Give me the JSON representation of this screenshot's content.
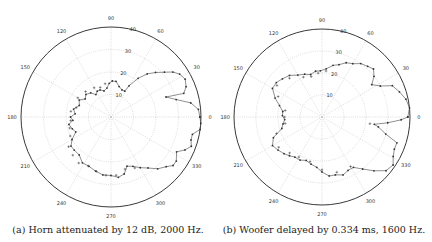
{
  "chart_data": [
    {
      "type": "polar-line",
      "title": "",
      "caption": "(a) Horn attenuated by 12 dB, 2000 Hz.",
      "angle_ticks": [
        0,
        30,
        60,
        90,
        120,
        150,
        180,
        210,
        240,
        270,
        300,
        330
      ],
      "radial_ticks": [
        10,
        20,
        30,
        40
      ],
      "radial_labels": [
        "10",
        "20",
        "30",
        "40"
      ],
      "rlim": [
        0,
        40
      ],
      "grid": true,
      "center_px": [
        111,
        117
      ],
      "outer_radius_px": 90,
      "series": [
        {
          "name": "measured",
          "marker": "dot",
          "points": [
            [
              0,
              39.5
            ],
            [
              5,
              39
            ],
            [
              10,
              36
            ],
            [
              15,
              30
            ],
            [
              20,
              26
            ],
            [
              18,
              34
            ],
            [
              22,
              36
            ],
            [
              27,
              37
            ],
            [
              32,
              36
            ],
            [
              36,
              34
            ],
            [
              40,
              31
            ],
            [
              45,
              28
            ],
            [
              50,
              25
            ],
            [
              55,
              21
            ],
            [
              60,
              16
            ],
            [
              62,
              13
            ],
            [
              68,
              13
            ],
            [
              75,
              14
            ],
            [
              82,
              16
            ],
            [
              88,
              16
            ],
            [
              93,
              15
            ],
            [
              98,
              13
            ],
            [
              105,
              12
            ],
            [
              112,
              13
            ],
            [
              118,
              13
            ],
            [
              124,
              12
            ],
            [
              130,
              14
            ],
            [
              138,
              15
            ],
            [
              145,
              14
            ],
            [
              152,
              16
            ],
            [
              160,
              15
            ],
            [
              168,
              17
            ],
            [
              175,
              16
            ],
            [
              180,
              18
            ],
            [
              185,
              17
            ],
            [
              190,
              19
            ],
            [
              197,
              18
            ],
            [
              203,
              17
            ],
            [
              210,
              20
            ],
            [
              216,
              22
            ],
            [
              222,
              22
            ],
            [
              230,
              22
            ],
            [
              238,
              24
            ],
            [
              246,
              24
            ],
            [
              254,
              25
            ],
            [
              262,
              26
            ],
            [
              270,
              26
            ],
            [
              277,
              27
            ],
            [
              283,
              26
            ],
            [
              288,
              23
            ],
            [
              294,
              24
            ],
            [
              300,
              26
            ],
            [
              306,
              28
            ],
            [
              312,
              31
            ],
            [
              318,
              33
            ],
            [
              322,
              35
            ],
            [
              326,
              35
            ],
            [
              332,
              33
            ],
            [
              336,
              36
            ],
            [
              340,
              38
            ],
            [
              344,
              37
            ],
            [
              348,
              37
            ],
            [
              352,
              40
            ],
            [
              356,
              40
            ],
            [
              360,
              39.5
            ]
          ]
        },
        {
          "name": "predicted",
          "marker": "plus",
          "points": [
            [
              100,
              15
            ],
            [
              110,
              14
            ],
            [
              120,
              15
            ],
            [
              135,
              16
            ],
            [
              150,
              17
            ],
            [
              165,
              16
            ],
            [
              172,
              18
            ],
            [
              185,
              18
            ],
            [
              195,
              19
            ],
            [
              205,
              20
            ],
            [
              215,
              23
            ],
            [
              225,
              24
            ],
            [
              235,
              25
            ],
            [
              245,
              24
            ],
            [
              255,
              25
            ],
            [
              265,
              26
            ],
            [
              275,
              26
            ],
            [
              285,
              24
            ],
            [
              295,
              25
            ]
          ]
        }
      ],
      "xlabel": "",
      "ylabel": ""
    },
    {
      "type": "polar-line",
      "title": "",
      "caption": "(b) Woofer delayed by 0.334 ms, 1600 Hz.",
      "angle_ticks": [
        0,
        30,
        60,
        90,
        120,
        150,
        180,
        210,
        240,
        270,
        300,
        330
      ],
      "radial_ticks": [
        10,
        20,
        30,
        40
      ],
      "radial_labels": [
        "10",
        "20",
        "30",
        "40"
      ],
      "rlim": [
        0,
        40
      ],
      "grid": true,
      "center_px": [
        322,
        117
      ],
      "outer_radius_px": 88,
      "series": [
        {
          "name": "measured",
          "marker": "dot",
          "points": [
            [
              0,
              39
            ],
            [
              6,
              40
            ],
            [
              12,
              39
            ],
            [
              18,
              37
            ],
            [
              24,
              35
            ],
            [
              28,
              30
            ],
            [
              33,
              27
            ],
            [
              38,
              30
            ],
            [
              43,
              32
            ],
            [
              48,
              31
            ],
            [
              54,
              30
            ],
            [
              60,
              28
            ],
            [
              66,
              27
            ],
            [
              72,
              25
            ],
            [
              78,
              24
            ],
            [
              85,
              22
            ],
            [
              92,
              21
            ],
            [
              98,
              21
            ],
            [
              105,
              20
            ],
            [
              112,
              21
            ],
            [
              120,
              22
            ],
            [
              128,
              24
            ],
            [
              136,
              25
            ],
            [
              143,
              26
            ],
            [
              150,
              26
            ],
            [
              158,
              23
            ],
            [
              165,
              20
            ],
            [
              172,
              18
            ],
            [
              178,
              18
            ],
            [
              184,
              17
            ],
            [
              190,
              18
            ],
            [
              196,
              19
            ],
            [
              203,
              24
            ],
            [
              210,
              26
            ],
            [
              217,
              25
            ],
            [
              224,
              24
            ],
            [
              230,
              23
            ],
            [
              236,
              22
            ],
            [
              243,
              22
            ],
            [
              250,
              21
            ],
            [
              257,
              22
            ],
            [
              264,
              23
            ],
            [
              270,
              25
            ],
            [
              277,
              27
            ],
            [
              283,
              27
            ],
            [
              290,
              28
            ],
            [
              296,
              27
            ],
            [
              302,
              27
            ],
            [
              308,
              30
            ],
            [
              314,
              34
            ],
            [
              320,
              38
            ],
            [
              326,
              39
            ],
            [
              331,
              37
            ],
            [
              336,
              36
            ],
            [
              341,
              36
            ],
            [
              345,
              30
            ],
            [
              350,
              26
            ],
            [
              352,
              24
            ],
            [
              355,
              30
            ],
            [
              358,
              36
            ],
            [
              360,
              39
            ]
          ]
        },
        {
          "name": "predicted",
          "marker": "plus",
          "points": [
            [
              85,
              21
            ],
            [
              95,
              20
            ],
            [
              105,
              19
            ],
            [
              115,
              20
            ],
            [
              130,
              23
            ],
            [
              145,
              25
            ],
            [
              155,
              22
            ],
            [
              170,
              17
            ],
            [
              180,
              17
            ],
            [
              190,
              17
            ],
            [
              200,
              22
            ],
            [
              215,
              24
            ],
            [
              228,
              22
            ],
            [
              240,
              21
            ],
            [
              255,
              21
            ],
            [
              270,
              24
            ],
            [
              285,
              26
            ],
            [
              300,
              26
            ],
            [
              352,
              22
            ]
          ]
        }
      ],
      "xlabel": "",
      "ylabel": ""
    }
  ],
  "panels": [
    {
      "caption": "(a) Horn attenuated by 12 dB, 2000 Hz."
    },
    {
      "caption": "(b) Woofer delayed by 0.334 ms, 1600 Hz."
    }
  ]
}
